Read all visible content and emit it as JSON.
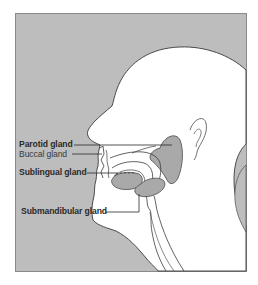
{
  "figure": {
    "type": "anatomical-diagram",
    "colors": {
      "background": "#ffffff",
      "panel": "#bdbdbd",
      "frame": "#8a8a8a",
      "outline": "#3a3a3a",
      "gland": "#a9a9a9",
      "text": "#2a2a2a"
    }
  },
  "labels": [
    {
      "id": "parotid",
      "text": "Parotid gland"
    },
    {
      "id": "buccal",
      "text": "Buccal gland"
    },
    {
      "id": "sublingual",
      "text": "Sublingual gland"
    },
    {
      "id": "submandibular",
      "text": "Submandibular gland"
    }
  ]
}
